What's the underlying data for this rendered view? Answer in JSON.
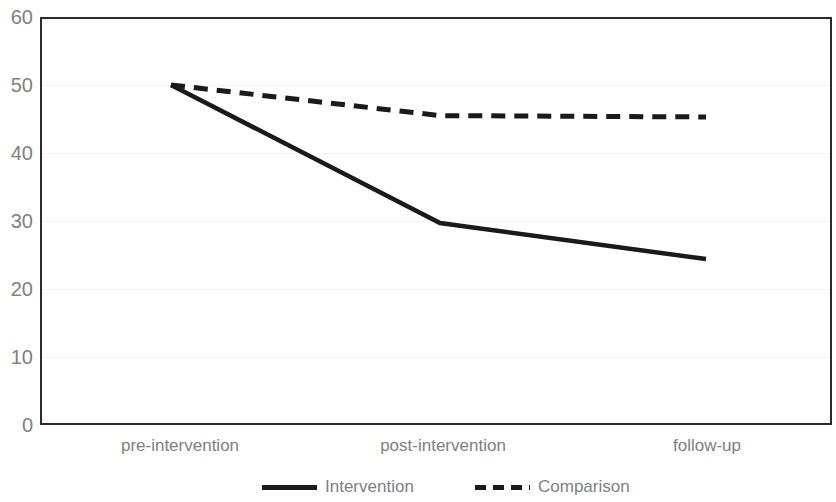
{
  "chart_data": {
    "type": "line",
    "title": "",
    "subtitle": "",
    "xlabel": "",
    "ylabel": "",
    "categories": [
      "pre-intervention",
      "post-intervention",
      "follow-up"
    ],
    "series": [
      {
        "name": "Intervention",
        "style": "solid",
        "color": "#1a1a1a",
        "values": [
          50,
          29.7,
          24.4
        ]
      },
      {
        "name": "Comparison",
        "style": "dashed",
        "color": "#1a1a1a",
        "values": [
          50,
          45.5,
          45.3
        ]
      }
    ],
    "ylim": [
      0,
      60
    ],
    "y_ticks": [
      0,
      10,
      20,
      30,
      40,
      50,
      60
    ],
    "y_tick_labels": [
      "0",
      "10",
      "20",
      "30",
      "40",
      "50",
      "60"
    ],
    "grid": true,
    "grid_color": "#f4f4f4",
    "legend_position": "bottom",
    "axis_color": "#2b2b2b",
    "tick_label_color": "#808080"
  },
  "axis": {
    "y_labels": [
      "60",
      "50",
      "40",
      "30",
      "20",
      "10",
      "0"
    ],
    "x_labels": [
      "pre-intervention",
      "post-intervention",
      "follow-up"
    ]
  },
  "legend": {
    "entries": [
      {
        "label": "Intervention",
        "style": "solid"
      },
      {
        "label": "Comparison",
        "style": "dashed"
      }
    ]
  }
}
